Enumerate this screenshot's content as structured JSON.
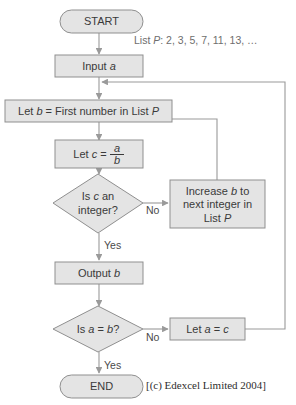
{
  "diagram": {
    "colors": {
      "shape_fill": "#e4e4e4",
      "shape_stroke": "#8f8f8f",
      "connector": "#9a9a9a",
      "text": "#3a3a3a",
      "background": "#ffffff"
    },
    "nodes": {
      "start": {
        "label": "START",
        "shape": "terminator"
      },
      "input_a": {
        "label": "Input a",
        "shape": "process"
      },
      "let_b": {
        "label": "Let b = First number in List P",
        "shape": "process"
      },
      "let_c": {
        "shape": "process",
        "prefix": "Let c =",
        "numerator": "a",
        "denominator": "b"
      },
      "is_c_integer": {
        "shape": "decision",
        "line1": "Is c an",
        "line2": "integer?"
      },
      "increase_b": {
        "shape": "process",
        "line1": "Increase b to",
        "line2": "next integer in",
        "line3": "List P"
      },
      "output_b": {
        "label": "Output b",
        "shape": "process"
      },
      "is_a_eq_b": {
        "label": "Is a = b?",
        "shape": "decision"
      },
      "let_a_eq_c": {
        "label": "Let a = c",
        "shape": "process"
      },
      "end": {
        "label": "END",
        "shape": "terminator"
      }
    },
    "edge_labels": {
      "no_integer": "No",
      "yes_integer": "Yes",
      "no_equal": "No",
      "yes_equal": "Yes"
    },
    "annotation": {
      "list_p": "List P: 2, 3, 5, 7, 11, 13, …"
    },
    "credit": "[(c) Edexcel Limited 2004]"
  }
}
